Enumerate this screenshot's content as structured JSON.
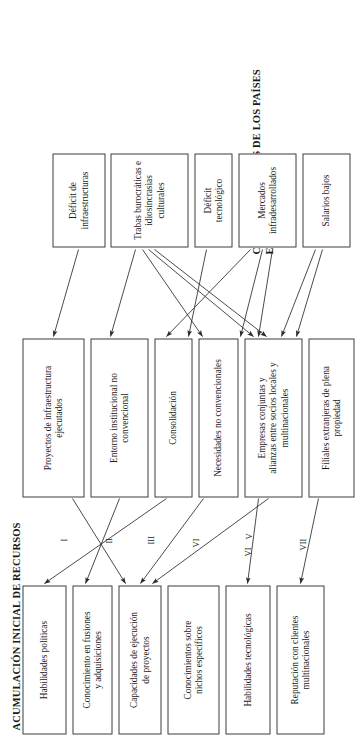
{
  "diagram": {
    "type": "flow-diagram",
    "orientation": "rotated-90-ccw",
    "headings": {
      "resources": "ACUMULACIÓN INICIAL DE RECURSOS",
      "characteristics": "CARACTERÍSTICAS DE LOS PAÍSES\nEN DESARROLLO"
    },
    "resource_boxes": [
      {
        "id": "r1",
        "label": "Habilidades políticas"
      },
      {
        "id": "r2",
        "label": "Conocimiento en fusiones\ny adquisiciones"
      },
      {
        "id": "r3",
        "label": "Capacidades de ejecución\nde proyectos"
      },
      {
        "id": "r4",
        "label": "Conocimientos sobre\nnichos específicos"
      },
      {
        "id": "r5",
        "label": "Habilidades tecnológicas"
      },
      {
        "id": "r6",
        "label": "Reputación con clientes\nmultinacionales"
      }
    ],
    "mechanism_boxes": [
      {
        "id": "m1",
        "label": "Proyectos de infraestructura\nejecutados"
      },
      {
        "id": "m2",
        "label": "Entorno institucional no\nconvencional"
      },
      {
        "id": "m3",
        "label": "Consolidación"
      },
      {
        "id": "m4",
        "label": "Necesidades no convencionales"
      },
      {
        "id": "m5",
        "label": "Empresas conjuntas y\nalianzas entre socios locales y\nmultinacionales"
      },
      {
        "id": "m6",
        "label": "Filiales extranjeras de plena\npropiedad"
      }
    ],
    "characteristic_boxes": [
      {
        "id": "c1",
        "label": "Déficit de infraestructuras"
      },
      {
        "id": "c2",
        "label": "Trabas burocráticas e\nidiosincrasias culturales"
      },
      {
        "id": "c3",
        "label": "Déficit\ntecnológico"
      },
      {
        "id": "c4",
        "label": "Mercados\ninfradesarrollados"
      },
      {
        "id": "c5",
        "label": "Salarios bajos"
      }
    ],
    "roman_labels": [
      {
        "id": "n1",
        "label": "I"
      },
      {
        "id": "n2",
        "label": "II"
      },
      {
        "id": "n3",
        "label": "III"
      },
      {
        "id": "n4",
        "label": "VI"
      },
      {
        "id": "n5",
        "label": "V"
      },
      {
        "id": "n6",
        "label": "VI"
      },
      {
        "id": "n7",
        "label": "VII"
      }
    ],
    "colors": {
      "box_border": "#3d3d3d",
      "arrow": "#2b2b2b",
      "text": "#1a1a1a",
      "background": "#ffffff"
    }
  }
}
